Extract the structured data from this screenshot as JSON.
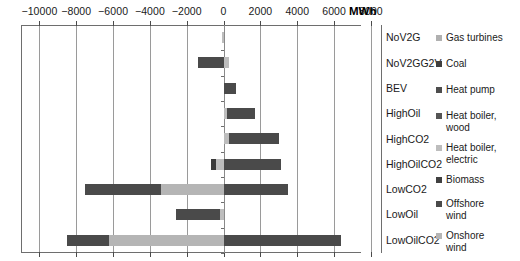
{
  "chart_data": {
    "type": "bar",
    "orientation": "horizontal",
    "stacked": true,
    "title": "",
    "xlabel": "MWh",
    "ylabel": "",
    "xlim": [
      -11000,
      8600
    ],
    "axis_unit": "MWh",
    "grid": true,
    "legend_position": "right",
    "xticks": [
      -10000,
      -8000,
      -6000,
      -4000,
      -2000,
      0,
      2000,
      4000,
      6000,
      8000
    ],
    "xticklabels": [
      "−10000",
      "−8000",
      "−6000",
      "−4000",
      "−2000",
      "0",
      "2000",
      "4000",
      "6000",
      "8000"
    ],
    "categories": [
      "NoV2G",
      "NoV2GG2V",
      "BEV",
      "HighOil",
      "HighCO2",
      "HighOilCO2",
      "LowCO2",
      "LowOil",
      "LowOilCO2"
    ],
    "series": [
      {
        "name": "Gas turbines",
        "color": "#b0b0b0",
        "values": [
          0,
          0,
          0,
          0,
          0,
          0,
          0,
          0,
          0
        ]
      },
      {
        "name": "Coal",
        "color": "#4d4d4d",
        "values": [
          0,
          0,
          0,
          0,
          0,
          -700,
          0,
          0,
          0
        ]
      },
      {
        "name": "Heat pump",
        "color": "#3f3f3f",
        "values": [
          0,
          0,
          0,
          0,
          0,
          0,
          0,
          0,
          0
        ]
      },
      {
        "name": "Heat boiler, wood",
        "color": "#595959",
        "values": [
          0,
          0,
          0,
          0,
          0,
          0,
          0,
          0,
          0
        ]
      },
      {
        "name": "Heat boiler, electric",
        "color": "#bdbdbd",
        "values": [
          -100,
          300,
          0,
          200,
          300,
          300,
          3500,
          300,
          6300
        ]
      },
      {
        "name": "Biomass",
        "color": "#4d4d4d",
        "values": [
          0,
          0,
          0,
          0,
          0,
          0,
          0,
          0,
          0
        ]
      },
      {
        "name": "Offshore wind",
        "color": "#4a4a4a",
        "values": [
          0,
          -1400,
          700,
          1500,
          2700,
          2800,
          -4100,
          -2400,
          -2300
        ]
      },
      {
        "name": "Onshore wind",
        "color": "#b5b5b5",
        "values": [
          0,
          0,
          0,
          0,
          0,
          0,
          -3400,
          0,
          -6200
        ]
      }
    ],
    "bars": [
      {
        "category": "NoV2G",
        "segments": [
          {
            "series": "Heat boiler, electric",
            "start": -100,
            "end": 0,
            "color": "#bdbdbd"
          }
        ]
      },
      {
        "category": "NoV2GG2V",
        "segments": [
          {
            "series": "Offshore wind",
            "start": -1400,
            "end": 0,
            "color": "#4a4a4a"
          },
          {
            "series": "Heat boiler, electric",
            "start": 0,
            "end": 300,
            "color": "#bdbdbd"
          }
        ]
      },
      {
        "category": "BEV",
        "segments": [
          {
            "series": "Offshore wind",
            "start": 0,
            "end": 700,
            "color": "#4a4a4a"
          }
        ]
      },
      {
        "category": "HighOil",
        "segments": [
          {
            "series": "Heat boiler, electric",
            "start": 0,
            "end": 200,
            "color": "#bdbdbd"
          },
          {
            "series": "Offshore wind",
            "start": 200,
            "end": 1700,
            "color": "#4a4a4a"
          }
        ]
      },
      {
        "category": "HighCO2",
        "segments": [
          {
            "series": "Heat boiler, electric",
            "start": 0,
            "end": 300,
            "color": "#bdbdbd"
          },
          {
            "series": "Offshore wind",
            "start": 300,
            "end": 3000,
            "color": "#4a4a4a"
          }
        ]
      },
      {
        "category": "HighOilCO2",
        "segments": [
          {
            "series": "Coal",
            "start": -700,
            "end": -400,
            "color": "#3a3a3a"
          },
          {
            "series": "Heat boiler, electric",
            "start": -400,
            "end": 0,
            "color": "#bdbdbd"
          },
          {
            "series": "Offshore wind",
            "start": 0,
            "end": 3100,
            "color": "#4a4a4a"
          }
        ]
      },
      {
        "category": "LowCO2",
        "segments": [
          {
            "series": "Offshore wind",
            "start": -7500,
            "end": -3400,
            "color": "#4a4a4a"
          },
          {
            "series": "Onshore wind",
            "start": -3400,
            "end": 0,
            "color": "#b5b5b5"
          },
          {
            "series": "Heat boiler, electric",
            "start": 0,
            "end": 3500,
            "color": "#4a4a4a"
          }
        ]
      },
      {
        "category": "LowOil",
        "segments": [
          {
            "series": "Offshore wind",
            "start": -2600,
            "end": -200,
            "color": "#4a4a4a"
          },
          {
            "series": "Heat boiler, electric",
            "start": -200,
            "end": 0,
            "color": "#bdbdbd"
          }
        ]
      },
      {
        "category": "LowOilCO2",
        "segments": [
          {
            "series": "Offshore wind",
            "start": -8500,
            "end": -6200,
            "color": "#4a4a4a"
          },
          {
            "series": "Onshore wind",
            "start": -6200,
            "end": 0,
            "color": "#b5b5b5"
          },
          {
            "series": "Heat boiler, electric",
            "start": 0,
            "end": 6400,
            "color": "#4a4a4a"
          }
        ]
      }
    ],
    "legend": [
      {
        "label": "Gas turbines",
        "color": "#b0b0b0"
      },
      {
        "label": "Coal",
        "color": "#3f3f3f"
      },
      {
        "label": "Heat pump",
        "color": "#4d4d4d"
      },
      {
        "label": "Heat boiler,\nwood",
        "color": "#555555"
      },
      {
        "label": "Heat boiler,\nelectric",
        "color": "#bdbdbd"
      },
      {
        "label": "Biomass",
        "color": "#404040"
      },
      {
        "label": "Offshore\nwind",
        "color": "#4a4a4a"
      },
      {
        "label": "Onshore\nwind",
        "color": "#b5b5b5"
      }
    ]
  }
}
